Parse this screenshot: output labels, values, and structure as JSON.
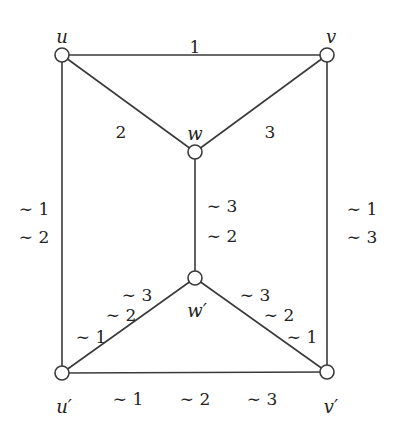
{
  "diagram": {
    "type": "graph",
    "colors": {
      "stroke": "#3a3a3a",
      "node_fill": "#ffffff",
      "text": "#222222",
      "background": "#ffffff"
    },
    "nodes": [
      {
        "id": "u",
        "label": "u",
        "x": 62,
        "y": 55,
        "lx": 62,
        "ly": 38
      },
      {
        "id": "v",
        "label": "v",
        "x": 327,
        "y": 55,
        "lx": 331,
        "ly": 38
      },
      {
        "id": "w",
        "label": "w",
        "x": 195,
        "y": 152,
        "lx": 195,
        "ly": 135
      },
      {
        "id": "wp",
        "label": "w′",
        "x": 195,
        "y": 278,
        "lx": 197,
        "ly": 312
      },
      {
        "id": "up",
        "label": "u′",
        "x": 62,
        "y": 373,
        "lx": 64,
        "ly": 408
      },
      {
        "id": "vp",
        "label": "v′",
        "x": 327,
        "y": 372,
        "lx": 331,
        "ly": 408
      }
    ],
    "edges": [
      {
        "from": "u",
        "to": "v",
        "labels": [
          {
            "text": "1",
            "x": 195,
            "y": 48
          }
        ]
      },
      {
        "from": "u",
        "to": "w",
        "labels": [
          {
            "text": "2",
            "x": 121,
            "y": 133
          }
        ]
      },
      {
        "from": "v",
        "to": "w",
        "labels": [
          {
            "text": "3",
            "x": 270,
            "y": 133
          }
        ]
      },
      {
        "from": "w",
        "to": "wp",
        "labels": [
          {
            "text": "∼ 3",
            "x": 222,
            "y": 207
          },
          {
            "text": "∼ 2",
            "x": 222,
            "y": 237
          }
        ]
      },
      {
        "from": "u",
        "to": "up",
        "labels": [
          {
            "text": "∼ 1",
            "x": 34,
            "y": 210
          },
          {
            "text": "∼ 2",
            "x": 34,
            "y": 238
          }
        ]
      },
      {
        "from": "v",
        "to": "vp",
        "labels": [
          {
            "text": "∼ 1",
            "x": 362,
            "y": 210
          },
          {
            "text": "∼ 3",
            "x": 362,
            "y": 238
          }
        ]
      },
      {
        "from": "wp",
        "to": "up",
        "labels": [
          {
            "text": "∼ 3",
            "x": 137,
            "y": 296
          },
          {
            "text": "∼ 2",
            "x": 121,
            "y": 316
          },
          {
            "text": "∼ 1",
            "x": 91,
            "y": 338
          }
        ]
      },
      {
        "from": "wp",
        "to": "vp",
        "labels": [
          {
            "text": "∼ 3",
            "x": 255,
            "y": 296
          },
          {
            "text": "∼ 2",
            "x": 279,
            "y": 316
          },
          {
            "text": "∼ 1",
            "x": 302,
            "y": 338
          }
        ]
      },
      {
        "from": "up",
        "to": "vp",
        "labels": [
          {
            "text": "∼ 1",
            "x": 128,
            "y": 400
          },
          {
            "text": "∼ 2",
            "x": 195,
            "y": 400
          },
          {
            "text": "∼ 3",
            "x": 262,
            "y": 400
          }
        ]
      }
    ]
  }
}
